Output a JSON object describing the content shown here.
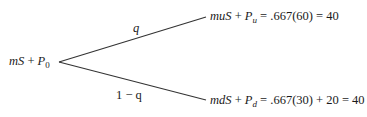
{
  "diagram": {
    "type": "binomial-tree",
    "root": {
      "var1": "mS",
      "plus": " + ",
      "var2": "P",
      "sub": "0"
    },
    "up_branch": {
      "prob_label": "q",
      "node": {
        "var1": "muS",
        "plus": " + ",
        "var2": "P",
        "sub": "u",
        "expr": " = .667(60) = 40"
      }
    },
    "down_branch": {
      "prob_label": "1 − q",
      "node": {
        "var1": "mdS",
        "plus": " + ",
        "var2": "P",
        "sub": "d",
        "expr": " = .667(30) + 20 = 40"
      }
    },
    "line_color": "#333333"
  }
}
